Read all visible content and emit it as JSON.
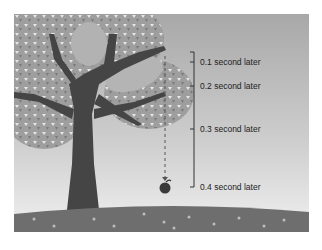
{
  "figure": {
    "type": "illustration",
    "colors": {
      "sky_top": "#a9a9a9",
      "sky_bottom": "#ededed",
      "ground": "#6f6f6f",
      "trunk": "#454545",
      "foliage": "#9c9c9c",
      "apple": "#3a3a3a",
      "bracket": "#333333"
    },
    "time_markers": [
      {
        "label": "0.1 second later",
        "y": 62
      },
      {
        "label": "0.2 second later",
        "y": 86
      },
      {
        "label": "0.3 second later",
        "y": 129
      },
      {
        "label": "0.4 second later",
        "y": 187
      }
    ]
  }
}
